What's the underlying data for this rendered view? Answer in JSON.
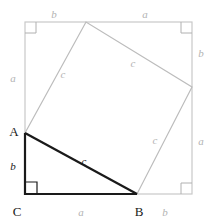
{
  "figure": {
    "name": "pythagorean-theorem-proof-diagram",
    "colors": {
      "outer_square_stroke": "#c9c9c9",
      "inner_square_stroke": "#bcbcbc",
      "triangle_stroke": "#1a1a1a",
      "right_angle_mark": "#b0b0b0",
      "right_angle_mark_dark": "#1a1a1a",
      "label_gray": "#b3b3b3",
      "label_dark": "#1a1a1a",
      "background": "#ffffff"
    },
    "geometry": {
      "outer_square": {
        "left": 25,
        "top": 22,
        "right": 192,
        "bottom": 194
      },
      "inner_square_vertices": [
        {
          "name": "A",
          "x": 25,
          "y": 133
        },
        {
          "name": "top",
          "x": 86,
          "y": 22
        },
        {
          "name": "right",
          "x": 192,
          "y": 87
        },
        {
          "name": "B",
          "x": 137,
          "y": 194
        }
      ],
      "triangle_vertices": [
        {
          "name": "A",
          "x": 25,
          "y": 133
        },
        {
          "name": "C",
          "x": 25,
          "y": 194
        },
        {
          "name": "B",
          "x": 137,
          "y": 194
        }
      ]
    }
  },
  "labels": {
    "top_b": {
      "text": "b",
      "x": 54,
      "y": 14
    },
    "top_a": {
      "text": "a",
      "x": 145,
      "y": 14
    },
    "right_b": {
      "text": "b",
      "x": 201,
      "y": 53
    },
    "right_a": {
      "text": "a",
      "x": 201,
      "y": 141
    },
    "left_a": {
      "text": "a",
      "x": 13,
      "y": 78
    },
    "left_b": {
      "text": "b",
      "x": 13,
      "y": 166
    },
    "bottom_a": {
      "text": "a",
      "x": 81,
      "y": 212
    },
    "bottom_b": {
      "text": "b",
      "x": 165,
      "y": 212
    },
    "c_upper_left": {
      "text": "c",
      "x": 63,
      "y": 74
    },
    "c_upper_right": {
      "text": "c",
      "x": 133,
      "y": 63
    },
    "c_lower_right": {
      "text": "c",
      "x": 155,
      "y": 140
    },
    "c_hypotenuse": {
      "text": "c",
      "x": 84,
      "y": 161
    },
    "vertex_a": {
      "text": "A",
      "x": 14,
      "y": 131
    },
    "vertex_b": {
      "text": "B",
      "x": 139,
      "y": 211
    },
    "vertex_c": {
      "text": "C",
      "x": 17,
      "y": 211
    }
  }
}
